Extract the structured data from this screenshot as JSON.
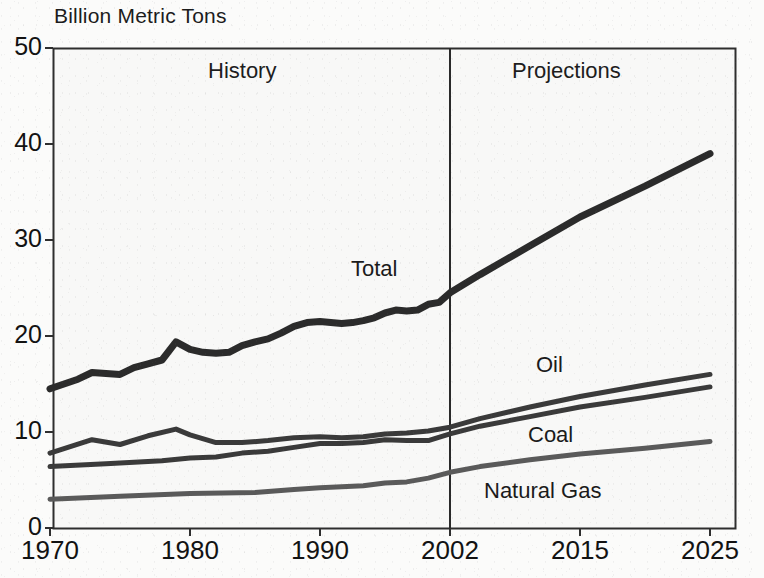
{
  "chart_data": {
    "type": "line",
    "title": "",
    "ylabel": "Billion Metric Tons",
    "xlabel": "",
    "ylim": [
      0,
      50
    ],
    "yticks": [
      0,
      10,
      20,
      30,
      40,
      50
    ],
    "xticks": [
      "1970",
      "1980",
      "1990",
      "2002",
      "2015",
      "2025"
    ],
    "xtick_years": [
      1970,
      1980,
      1990,
      2002,
      2015,
      2025
    ],
    "xlim": [
      1970,
      2025
    ],
    "grid": false,
    "legend_position": "inline-labels",
    "annotations": [
      {
        "text": "History",
        "x": 1982,
        "y": 47.5
      },
      {
        "text": "Projections",
        "x": 2011,
        "y": 47.5
      }
    ],
    "divider": {
      "x": 2002,
      "label": "history/projection boundary"
    },
    "series": [
      {
        "name": "Total",
        "color": "#2b2b2b",
        "width": 7,
        "label_x": 1988.5,
        "label_y": 25.8,
        "x": [
          1970,
          1971,
          1972,
          1973,
          1974,
          1975,
          1976,
          1977,
          1978,
          1979,
          1980,
          1981,
          1982,
          1983,
          1984,
          1985,
          1986,
          1987,
          1988,
          1989,
          1990,
          1991,
          1992,
          1993,
          1994,
          1995,
          1996,
          1997,
          1998,
          1999,
          2000,
          2001,
          2002,
          2005,
          2010,
          2015,
          2020,
          2025
        ],
        "y": [
          14.5,
          15.0,
          15.5,
          16.2,
          16.1,
          16.0,
          16.7,
          17.1,
          17.5,
          19.4,
          18.6,
          18.3,
          18.2,
          18.3,
          19.0,
          19.4,
          19.7,
          20.3,
          21.0,
          21.4,
          21.5,
          21.4,
          21.3,
          21.4,
          21.6,
          21.9,
          22.4,
          22.7,
          22.6,
          22.7,
          23.3,
          23.5,
          24.5,
          26.4,
          29.4,
          32.4,
          35.6,
          39.0
        ]
      },
      {
        "name": "Oil",
        "color": "#3a3a3a",
        "width": 5,
        "label_x": 2008.5,
        "label_y": 18.2,
        "x": [
          1970,
          1973,
          1975,
          1977,
          1979,
          1980,
          1982,
          1984,
          1986,
          1988,
          1990,
          1992,
          1994,
          1996,
          1998,
          2000,
          2002,
          2005,
          2010,
          2015,
          2020,
          2025
        ],
        "y": [
          7.8,
          9.2,
          8.7,
          9.6,
          10.3,
          9.7,
          8.9,
          8.9,
          9.1,
          9.4,
          9.5,
          9.4,
          9.5,
          9.8,
          9.9,
          10.1,
          10.5,
          11.4,
          12.6,
          13.7,
          14.9,
          16.0
        ]
      },
      {
        "name": "Coal",
        "color": "#3a3a3a",
        "width": 5,
        "label_x": 2008.5,
        "label_y": 11.1,
        "x": [
          1970,
          1974,
          1978,
          1980,
          1982,
          1984,
          1986,
          1988,
          1990,
          1992,
          1994,
          1996,
          1998,
          2000,
          2002,
          2005,
          2010,
          2015,
          2020,
          2025
        ],
        "y": [
          6.4,
          6.7,
          7.0,
          7.3,
          7.4,
          7.8,
          8.0,
          8.4,
          8.8,
          8.8,
          8.9,
          9.2,
          9.1,
          9.1,
          9.8,
          10.6,
          11.6,
          12.6,
          13.6,
          14.7
        ]
      },
      {
        "name": "Natural Gas",
        "color": "#5a5a5a",
        "width": 5,
        "label_x": 2003.5,
        "label_y": 4.2,
        "x": [
          1970,
          1975,
          1980,
          1985,
          1988,
          1990,
          1992,
          1994,
          1996,
          1998,
          2000,
          2002,
          2005,
          2010,
          2015,
          2020,
          2025
        ],
        "y": [
          3.0,
          3.3,
          3.6,
          3.7,
          4.0,
          4.2,
          4.3,
          4.4,
          4.7,
          4.8,
          5.2,
          5.8,
          6.4,
          7.1,
          7.7,
          8.3,
          9.0
        ]
      }
    ]
  }
}
